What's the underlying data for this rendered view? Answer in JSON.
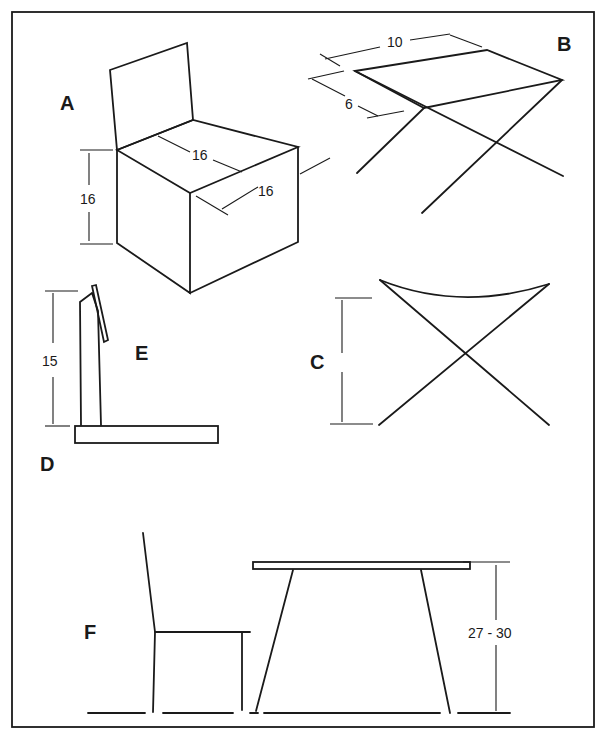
{
  "figure": {
    "panels": {
      "A": {
        "label": "A",
        "seat_depth": "16",
        "seat_width": "16",
        "seat_height": "16"
      },
      "B": {
        "label": "B",
        "top_length": "10",
        "top_width": "6"
      },
      "C": {
        "label": "C"
      },
      "D": {
        "label": "D"
      },
      "E": {
        "label": "E",
        "height": "15"
      },
      "F": {
        "label": "F",
        "table_height": "27 - 30"
      }
    },
    "colors": {
      "ink": "#1a1a1a",
      "paper": "#ffffff"
    }
  }
}
